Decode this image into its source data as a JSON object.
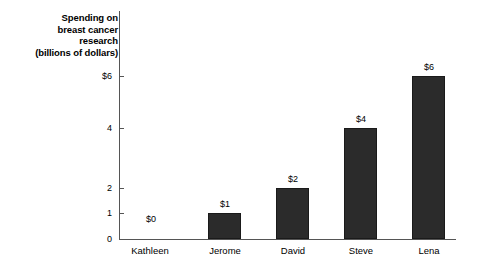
{
  "chart_data": {
    "type": "bar",
    "title": "Spending on breast cancer research (billions of dollars)",
    "title_lines": [
      "Spending on",
      "breast cancer",
      "research",
      "(billions of dollars)"
    ],
    "xlabel": "",
    "ylabel": "Spending on breast cancer research (billions of dollars)",
    "categories": [
      "Kathleen",
      "Jerome",
      "David",
      "Steve",
      "Lena"
    ],
    "values": [
      0,
      1,
      2,
      4,
      6
    ],
    "value_labels": [
      "$0",
      "$1",
      "$2",
      "$4",
      "$6"
    ],
    "ytick_values": [
      0,
      1,
      2,
      4,
      6
    ],
    "ytick_labels": [
      "0",
      "1",
      "2",
      "4",
      "6"
    ],
    "ytick_display": [
      "0",
      "1",
      "2",
      "4",
      "$6"
    ],
    "ylim": [
      0,
      6
    ],
    "grid": false,
    "legend": false,
    "axis_note": "non-linear y-axis spacing between 2 and 4",
    "bar_color": "#2b2b2b",
    "axis_color": "#555555",
    "background": "#ffffff"
  },
  "bars": [
    {
      "label": "Kathleen",
      "value_label": "$0",
      "left": 121,
      "top": 228,
      "width": 33,
      "height": 0,
      "label_left": 110,
      "value_left": 121
    },
    {
      "label": "Jerome",
      "value_label": "$1",
      "left": 208,
      "top": 213,
      "width": 33,
      "height": 26,
      "label_left": 185,
      "value_left": 195
    },
    {
      "label": "David",
      "value_label": "$2",
      "left": 276,
      "top": 188,
      "width": 33,
      "height": 51,
      "label_left": 253,
      "value_left": 263
    },
    {
      "label": "Steve",
      "value_label": "$4",
      "left": 344,
      "top": 128,
      "width": 33,
      "height": 111,
      "label_left": 321,
      "value_left": 331
    },
    {
      "label": "Lena",
      "value_label": "$6",
      "left": 412,
      "top": 76,
      "width": 33,
      "height": 163,
      "label_left": 389,
      "value_left": 399
    }
  ],
  "yticks": [
    {
      "label": "$6",
      "top": 76
    },
    {
      "label": "4",
      "top": 128
    },
    {
      "label": "2",
      "top": 188
    },
    {
      "label": "1",
      "top": 213
    },
    {
      "label": "0",
      "top": 239
    }
  ]
}
